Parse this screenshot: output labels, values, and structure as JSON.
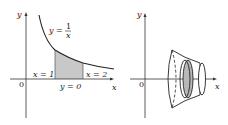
{
  "left_panel": {
    "axis_y_label": "y",
    "axis_x_label": "x",
    "origin_label": "0",
    "curve_label_lhs": "y =",
    "curve_label_num": "1",
    "curve_label_den": "x",
    "bound_left": "x = 1",
    "bound_right": "x = 2",
    "bound_bottom": "y = 0",
    "shade_color": "#c8c8c8"
  },
  "right_panel": {
    "axis_y_label": "y",
    "axis_x_label": "x",
    "origin_label": "0",
    "disk_color": "#b8b8b8"
  }
}
